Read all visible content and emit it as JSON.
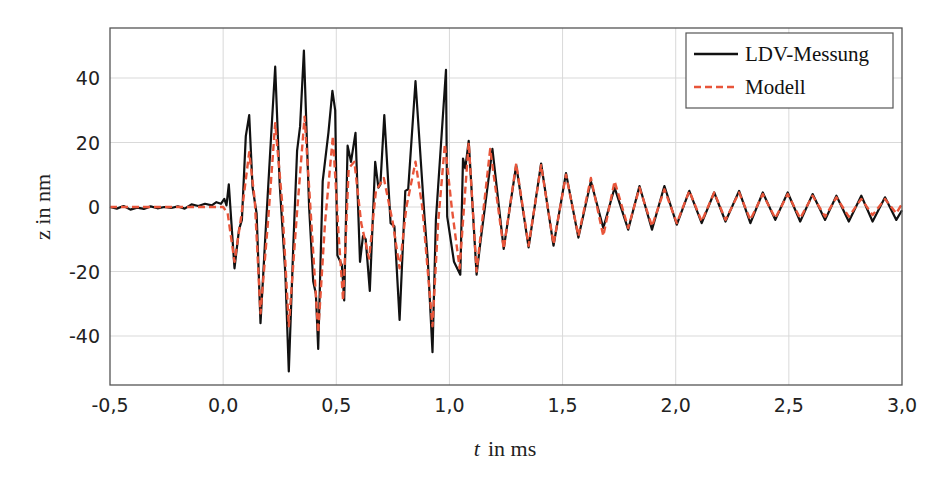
{
  "chart_data": {
    "type": "line",
    "title": "",
    "xlabel": "t in ms",
    "xlabel_italic_part": "t",
    "xlabel_rest": "in ms",
    "ylabel": "z in nm",
    "xlim": [
      -0.5,
      3.0
    ],
    "ylim": [
      -54,
      56
    ],
    "grid": true,
    "legend_position": "upper right",
    "x_ticks": [
      -0.5,
      0.0,
      0.5,
      1.0,
      1.5,
      2.0,
      2.5,
      3.0
    ],
    "x_tick_labels": [
      "-0,5",
      "0,0",
      "0,5",
      "1,0",
      "1,5",
      "2,0",
      "2,5",
      "3,0"
    ],
    "y_ticks": [
      40,
      20,
      0,
      -20,
      -40
    ],
    "y_tick_labels": [
      "40",
      "20",
      "0",
      "-20",
      "-40"
    ],
    "series": [
      {
        "name": "LDV-Messung",
        "color": "#111111",
        "style": "solid",
        "t": [
          -0.5,
          -0.47,
          -0.44,
          -0.41,
          -0.38,
          -0.35,
          -0.32,
          -0.29,
          -0.26,
          -0.23,
          -0.2,
          -0.17,
          -0.14,
          -0.11,
          -0.08,
          -0.05,
          -0.03,
          -0.01,
          0.005,
          0.015,
          0.025,
          0.05,
          0.07,
          0.083,
          0.1,
          0.115,
          0.13,
          0.148,
          0.165,
          0.19,
          0.213,
          0.23,
          0.25,
          0.275,
          0.29,
          0.31,
          0.327,
          0.34,
          0.357,
          0.38,
          0.398,
          0.41,
          0.42,
          0.44,
          0.465,
          0.483,
          0.495,
          0.505,
          0.525,
          0.535,
          0.55,
          0.565,
          0.585,
          0.605,
          0.618,
          0.63,
          0.648,
          0.672,
          0.686,
          0.695,
          0.712,
          0.74,
          0.757,
          0.78,
          0.805,
          0.818,
          0.85,
          0.89,
          0.905,
          0.925,
          0.94,
          0.985,
          0.99,
          1.02,
          1.048,
          1.06,
          1.07,
          1.085,
          1.12,
          1.135,
          1.19,
          1.24,
          1.295,
          1.35,
          1.405,
          1.46,
          1.515,
          1.57,
          1.625,
          1.68,
          1.73,
          1.79,
          1.84,
          1.895,
          1.95,
          2.005,
          2.06,
          2.115,
          2.17,
          2.22,
          2.28,
          2.33,
          2.385,
          2.44,
          2.495,
          2.55,
          2.605,
          2.66,
          2.71,
          2.765,
          2.82,
          2.87,
          2.925,
          2.975,
          3.0
        ],
        "z": [
          0,
          -0.5,
          0.3,
          -0.8,
          -0.2,
          -0.6,
          0.2,
          -0.4,
          0,
          -0.3,
          0.2,
          -0.5,
          0.8,
          0.3,
          1,
          0.5,
          1.5,
          1,
          2.5,
          0.5,
          7,
          -19,
          -7,
          -4,
          22,
          28.5,
          6,
          -2,
          -36,
          -5,
          23,
          43.5,
          7,
          -21,
          -51,
          -12,
          17.5,
          25,
          48.5,
          0,
          -23,
          -27,
          -44,
          8,
          23,
          36,
          30,
          -15,
          -18,
          -29,
          19,
          14,
          23,
          -17,
          -9,
          -10,
          -26,
          14,
          6,
          7,
          28.5,
          -5,
          -6,
          -35,
          5,
          5.5,
          39,
          -3,
          -17,
          -45,
          -4,
          42.5,
          -3,
          -17,
          -21,
          15,
          12,
          20.5,
          -21,
          -12,
          18,
          -13,
          13,
          -12.5,
          13.5,
          -12,
          10.5,
          -9.5,
          8,
          -6.5,
          6,
          -7,
          6.5,
          -7,
          6.5,
          -5.5,
          5,
          -5,
          4.5,
          -4.5,
          5,
          -5,
          4.5,
          -4,
          4.5,
          -4.5,
          4,
          -4,
          3.5,
          -4.5,
          3.5,
          -4.5,
          3,
          -4,
          -1
        ]
      },
      {
        "name": "Modell",
        "color": "#e8553a",
        "style": "dashed",
        "t": [
          -0.5,
          -0.4,
          -0.3,
          -0.2,
          -0.1,
          0,
          0.02,
          0.05,
          0.08,
          0.115,
          0.14,
          0.165,
          0.2,
          0.23,
          0.26,
          0.29,
          0.325,
          0.36,
          0.39,
          0.42,
          0.45,
          0.485,
          0.51,
          0.53,
          0.555,
          0.58,
          0.61,
          0.645,
          0.675,
          0.71,
          0.75,
          0.78,
          0.81,
          0.85,
          0.88,
          0.925,
          0.95,
          0.98,
          1.01,
          1.045,
          1.085,
          1.12,
          1.18,
          1.24,
          1.295,
          1.35,
          1.405,
          1.46,
          1.515,
          1.57,
          1.625,
          1.68,
          1.73,
          1.79,
          1.84,
          1.895,
          1.95,
          2.005,
          2.06,
          2.115,
          2.17,
          2.22,
          2.28,
          2.33,
          2.385,
          2.44,
          2.495,
          2.55,
          2.605,
          2.66,
          2.71,
          2.765,
          2.82,
          2.87,
          2.925,
          2.975,
          3.0
        ],
        "z": [
          0,
          0,
          0,
          0,
          0,
          0,
          -2,
          -17,
          -3,
          17,
          2,
          -33,
          -3,
          26,
          2,
          -37,
          -3,
          28,
          -5,
          -39,
          -5,
          22,
          -8,
          -29,
          12,
          14,
          -5,
          -16,
          5,
          9,
          -5,
          -19,
          0,
          14,
          0,
          -37,
          -5,
          19.5,
          0,
          -19,
          20,
          -20,
          18,
          -13,
          13.5,
          -12,
          13,
          -11.5,
          10,
          -9,
          9,
          -9,
          8,
          -6.5,
          6,
          -6,
          5.5,
          -5,
          5,
          -4.5,
          4.5,
          -4,
          4.5,
          -4,
          4,
          -3.5,
          4,
          -3.5,
          3.5,
          -3,
          3,
          -3,
          2.5,
          -2.5,
          2.5,
          -2,
          1
        ]
      }
    ]
  },
  "legend": {
    "items": [
      {
        "label": "LDV-Messung",
        "color": "#111111",
        "style": "solid"
      },
      {
        "label": "Modell",
        "color": "#e8553a",
        "style": "dashed"
      }
    ]
  },
  "colors": {
    "measurement": "#111111",
    "model": "#e8553a",
    "grid": "#d9d9d9",
    "frame": "#555555"
  }
}
